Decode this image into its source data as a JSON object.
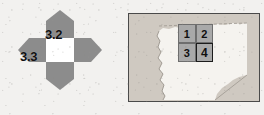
{
  "figure": {
    "background_color": "#f2f1ef",
    "ink_color": "#111111"
  },
  "petal_diagram": {
    "name": "four-direction-petal-diagram",
    "center_fill": "#ffffff",
    "petal_fill": "#8c8c8c",
    "petals": [
      {
        "direction": "up",
        "label": "3.2"
      },
      {
        "direction": "left",
        "label": "3.3"
      },
      {
        "direction": "right",
        "label": ""
      },
      {
        "direction": "down",
        "label": ""
      }
    ],
    "labels": {
      "top": "3.2",
      "left": "3.3"
    }
  },
  "map_panel": {
    "name": "map-panel",
    "border_color": "#4a4a4a",
    "land_fill": "#f4f2ee",
    "surround_fill": "#cfc9c1",
    "grid": {
      "rows": 2,
      "columns": 2,
      "cell_fill": "#a9a9a9",
      "selected_cell": "4",
      "cells": [
        {
          "id": "c1",
          "label": "1",
          "selected": false
        },
        {
          "id": "c2",
          "label": "2",
          "selected": false
        },
        {
          "id": "c3",
          "label": "3",
          "selected": false
        },
        {
          "id": "c4",
          "label": "4",
          "selected": true
        }
      ]
    }
  }
}
